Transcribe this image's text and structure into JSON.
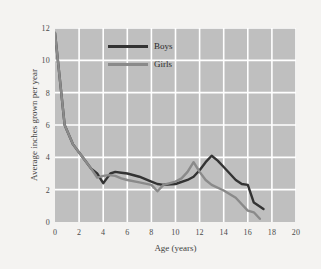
{
  "chart_data": {
    "type": "line",
    "title": "",
    "xlabel": "Age (years)",
    "ylabel": "Average inches grown per year",
    "xlim": [
      0,
      20
    ],
    "ylim": [
      0,
      12
    ],
    "xticks": [
      0,
      2,
      4,
      6,
      8,
      10,
      12,
      14,
      16,
      18,
      20
    ],
    "yticks": [
      0,
      2,
      4,
      6,
      8,
      10,
      12
    ],
    "xtick_labels": [
      "0",
      "2",
      "4",
      "6",
      "8",
      "10",
      "12",
      "14",
      "16",
      "18",
      "20"
    ],
    "ytick_labels": [
      "0",
      "2",
      "4",
      "6",
      "8",
      "10",
      "12"
    ],
    "grid": true,
    "grid_color": "#ffffff",
    "plot_bgcolor": "#bfbfbf",
    "figure_bgcolor": "#f4f3f1",
    "legend_position": "upper-center",
    "series": [
      {
        "name": "Boys",
        "color": "#333333",
        "x": [
          0,
          0.8,
          1.5,
          2,
          2.5,
          3,
          3.5,
          4,
          4.3,
          4.6,
          5,
          5.5,
          6,
          7,
          8,
          8.5,
          9,
          10,
          11,
          11.5,
          12,
          12.5,
          13,
          13.5,
          14,
          15,
          15.5,
          16,
          16.5,
          17.3
        ],
        "y": [
          11.7,
          6.0,
          4.8,
          4.3,
          3.8,
          3.3,
          3.0,
          2.4,
          2.7,
          3.0,
          3.1,
          3.05,
          3.0,
          2.8,
          2.5,
          2.35,
          2.3,
          2.35,
          2.6,
          2.8,
          3.2,
          3.7,
          4.1,
          3.8,
          3.4,
          2.6,
          2.35,
          2.3,
          1.2,
          0.8
        ]
      },
      {
        "name": "Girls",
        "color": "#8a8a8a",
        "x": [
          0,
          0.8,
          1.5,
          2,
          2.5,
          3,
          3.5,
          4,
          4.5,
          5,
          5.5,
          6,
          7,
          8,
          8.5,
          9,
          10,
          10.5,
          11,
          11.5,
          12,
          12.5,
          13,
          14,
          15,
          15.5,
          16,
          16.5,
          17
        ],
        "y": [
          11.7,
          6.0,
          4.8,
          4.3,
          3.8,
          3.3,
          2.75,
          2.85,
          2.9,
          2.85,
          2.7,
          2.6,
          2.45,
          2.3,
          1.9,
          2.3,
          2.5,
          2.7,
          3.1,
          3.7,
          3.1,
          2.6,
          2.3,
          1.95,
          1.5,
          1.1,
          0.7,
          0.6,
          0.2
        ]
      }
    ]
  },
  "legend": {
    "items": [
      {
        "label": "Boys",
        "color": "#333333"
      },
      {
        "label": "Girls",
        "color": "#8a8a8a"
      }
    ]
  }
}
